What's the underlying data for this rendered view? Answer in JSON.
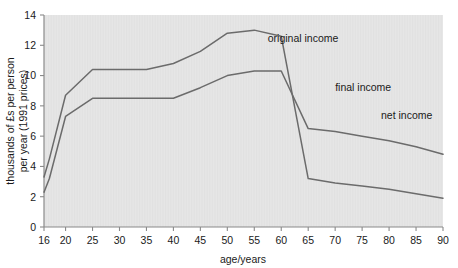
{
  "chart_data": {
    "type": "line",
    "title": "",
    "subtitle": "",
    "xlabel": "age/years",
    "ylabel": "thousands of £s per person per year (1991 prices)",
    "ylabel_line1": "thousands of £s per person",
    "ylabel_line2": "per year (1991 prices)",
    "xlim": [
      16,
      90
    ],
    "ylim": [
      0,
      14
    ],
    "xticks": [
      16,
      20,
      25,
      30,
      35,
      40,
      45,
      50,
      55,
      60,
      65,
      70,
      75,
      80,
      85,
      90
    ],
    "xticklabels": [
      "16",
      "20",
      "25",
      "30",
      "35",
      "40",
      "45",
      "50",
      "55",
      "60",
      "65",
      "70",
      "75",
      "80",
      "85",
      "90"
    ],
    "yticks": [
      0,
      2,
      4,
      6,
      8,
      10,
      12,
      14
    ],
    "yticklabels": [
      "0",
      "2",
      "4",
      "6",
      "8",
      "10",
      "12",
      "14"
    ],
    "grid": false,
    "legend_position": "inline-annotations",
    "line_color": "#6b6b6b",
    "plot_background": "#e6e6e6",
    "series": [
      {
        "name": "original income",
        "label": "original income",
        "x": [
          16,
          17,
          20,
          25,
          30,
          35,
          40,
          45,
          50,
          55,
          60,
          65,
          70,
          75,
          80,
          85,
          90
        ],
        "values": [
          3.3,
          4.5,
          8.7,
          10.4,
          10.4,
          10.4,
          10.8,
          11.6,
          12.8,
          13.0,
          12.6,
          3.2,
          2.9,
          2.7,
          2.5,
          2.2,
          1.9
        ]
      },
      {
        "name": "final income",
        "label": "final income",
        "x": [
          16,
          17,
          20,
          25,
          30,
          35,
          40,
          45,
          50,
          55,
          60,
          65,
          70,
          75,
          80,
          85,
          90
        ],
        "values": [
          2.3,
          3.2,
          7.3,
          8.5,
          8.5,
          8.5,
          8.5,
          9.2,
          10.0,
          10.3,
          10.3,
          6.5,
          6.3,
          6.0,
          5.7,
          5.3,
          4.8
        ]
      },
      {
        "name": "net income",
        "label": "net income"
      }
    ],
    "annotations": [
      {
        "text": "original income",
        "x": 57.5,
        "y": 12.2
      },
      {
        "text": "final income",
        "x": 70.0,
        "y": 9.0
      },
      {
        "text": "net income",
        "x": 78.5,
        "y": 7.1
      }
    ]
  }
}
